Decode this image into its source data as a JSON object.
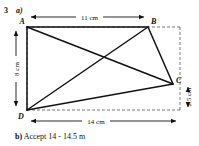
{
  "question": {
    "number": "3",
    "part_a_label": "a)",
    "part_b_label": "b)",
    "part_b_answer": "Accept 14 - 14.5 m"
  },
  "figure": {
    "type": "geometry-quadrilateral-diagram",
    "vertices": [
      {
        "id": "A",
        "label": "A",
        "x": 27,
        "y": 27
      },
      {
        "id": "B",
        "label": "B",
        "x": 148,
        "y": 27
      },
      {
        "id": "C",
        "label": "C",
        "x": 173,
        "y": 84
      },
      {
        "id": "D",
        "label": "D",
        "x": 27,
        "y": 110
      }
    ],
    "solid_edges": [
      [
        "A",
        "B"
      ],
      [
        "B",
        "C"
      ],
      [
        "C",
        "D"
      ],
      [
        "D",
        "A"
      ],
      [
        "A",
        "C"
      ],
      [
        "B",
        "D"
      ]
    ],
    "bounding_box_dashed": {
      "x": 27,
      "y": 27,
      "width": 153,
      "height": 83
    },
    "dimensions": [
      {
        "name": "top",
        "text": "11 cm",
        "value": 11,
        "unit": "cm",
        "from": "A",
        "to": "B",
        "orientation": "horizontal"
      },
      {
        "name": "left",
        "text": "8 cm",
        "value": 8,
        "unit": "cm",
        "from": "A",
        "to": "D",
        "orientation": "vertical"
      },
      {
        "name": "bottom",
        "text": "14 cm",
        "value": 14,
        "unit": "cm",
        "from": "D",
        "to": "bottom-right",
        "orientation": "horizontal"
      },
      {
        "name": "right",
        "text": "2.5 cm",
        "value": 2.5,
        "unit": "cm",
        "from": "C",
        "to": "bottom-right",
        "orientation": "vertical"
      }
    ],
    "colors": {
      "ink": "#111111",
      "paper": "#ffffff",
      "dashed": "#555555"
    }
  }
}
